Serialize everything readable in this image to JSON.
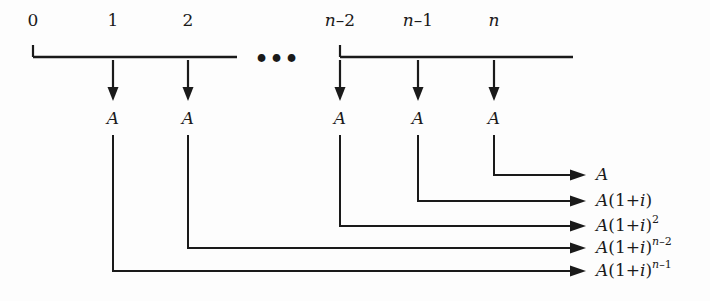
{
  "figure": {
    "ink_color": "#1a1a1a",
    "background_color": "#fdfdfd",
    "ellipsis": "•••"
  },
  "timeline": {
    "period_labels": [
      {
        "id": "period-0",
        "text": "0",
        "x": 33
      },
      {
        "id": "period-1",
        "text": "1",
        "x": 113
      },
      {
        "id": "period-2",
        "text": "2",
        "x": 188
      },
      {
        "id": "period-n-2",
        "text": "n–2",
        "x": 340
      },
      {
        "id": "period-n-1",
        "text": "n–1",
        "x": 418
      },
      {
        "id": "period-n",
        "text": "n",
        "x": 494
      }
    ],
    "segments": [
      {
        "id": "segment-left",
        "x1": 33,
        "x2": 237
      },
      {
        "id": "segment-right",
        "x1": 340,
        "x2": 573
      }
    ],
    "axis_y": 57,
    "ellipsis_x": 277,
    "ellipsis_y": 66
  },
  "payments": {
    "label": "A",
    "arrows": [
      {
        "id": "payment-arrow-1",
        "x": 113
      },
      {
        "id": "payment-arrow-2",
        "x": 188
      },
      {
        "id": "payment-arrow-n-2",
        "x": 340
      },
      {
        "id": "payment-arrow-n-1",
        "x": 418
      },
      {
        "id": "payment-arrow-n",
        "x": 494
      }
    ],
    "arrow_top_y": 60,
    "arrow_tip_y": 101,
    "label_y": 124
  },
  "accumulation": {
    "arrow_tip_x": 586,
    "label_x": 596,
    "rows": [
      {
        "id": "future-value-n",
        "from_x": 494,
        "y": 175,
        "base": "A",
        "factor": "",
        "exponent": "",
        "plain": "A"
      },
      {
        "id": "future-value-n-1",
        "from_x": 418,
        "y": 201,
        "base": "A",
        "factor": "(1+i)",
        "exponent": "",
        "plain": "A(1+i)"
      },
      {
        "id": "future-value-n-2",
        "from_x": 340,
        "y": 226,
        "base": "A",
        "factor": "(1+i)",
        "exponent": "2",
        "plain": "A(1+i)2"
      },
      {
        "id": "future-value-2",
        "from_x": 188,
        "y": 248,
        "base": "A",
        "factor": "(1+i)",
        "exponent": "n–2",
        "plain": "A(1+i)n–2"
      },
      {
        "id": "future-value-1",
        "from_x": 113,
        "y": 271,
        "base": "A",
        "factor": "(1+i)",
        "exponent": "n–1",
        "plain": "A(1+i)n–1"
      }
    ]
  }
}
